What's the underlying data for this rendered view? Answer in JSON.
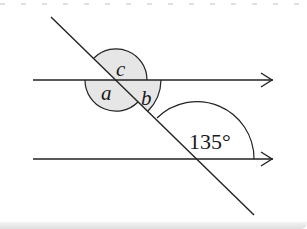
{
  "figure": {
    "colors": {
      "stroke": "#222222",
      "shade": "#e6e6e6",
      "background": "#ffffff"
    },
    "parallel_lines": [
      {
        "name": "upper-line",
        "arrow": "right"
      },
      {
        "name": "lower-line",
        "arrow": "right"
      }
    ],
    "angles": {
      "a": "a",
      "b": "b",
      "c": "c",
      "given": "135°"
    }
  }
}
